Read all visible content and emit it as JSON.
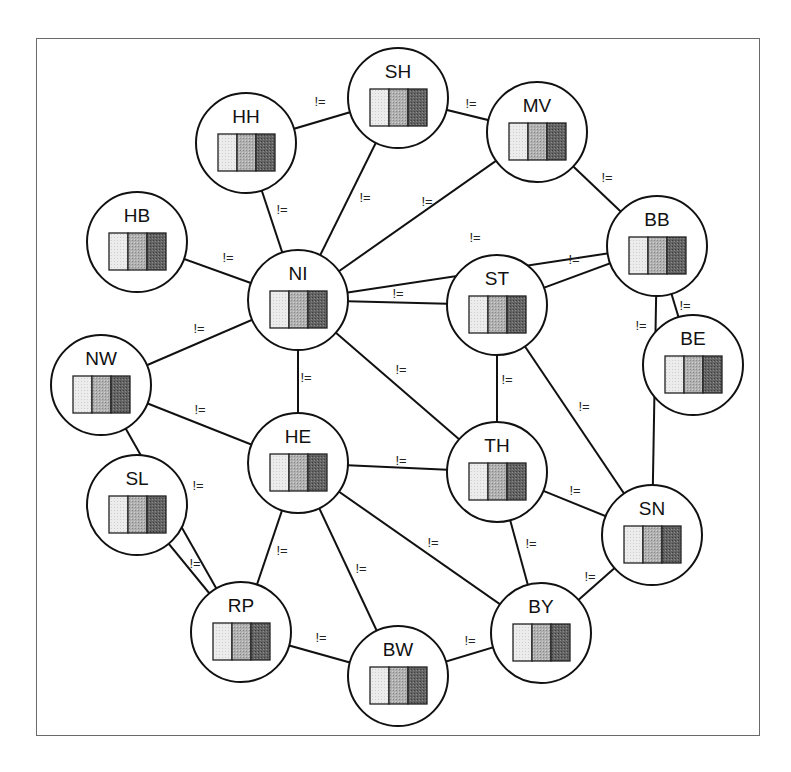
{
  "diagram": {
    "type": "constraint-graph",
    "edge_label": "!=",
    "frame": {
      "x": 36,
      "y": 38,
      "w": 724,
      "h": 698
    },
    "node_radius": 50,
    "swatch_colors": [
      "#e8e8e8",
      "#a9a9a9",
      "#5e5e5e"
    ],
    "nodes": [
      {
        "id": "SH",
        "label": "SH",
        "x": 398,
        "y": 98
      },
      {
        "id": "HH",
        "label": "HH",
        "x": 246,
        "y": 143
      },
      {
        "id": "MV",
        "label": "MV",
        "x": 537,
        "y": 132
      },
      {
        "id": "HB",
        "label": "HB",
        "x": 137,
        "y": 242
      },
      {
        "id": "BB",
        "label": "BB",
        "x": 657,
        "y": 246
      },
      {
        "id": "NI",
        "label": "NI",
        "x": 298,
        "y": 300
      },
      {
        "id": "ST",
        "label": "ST",
        "x": 497,
        "y": 305
      },
      {
        "id": "BE",
        "label": "BE",
        "x": 693,
        "y": 365
      },
      {
        "id": "NW",
        "label": "NW",
        "x": 101,
        "y": 385
      },
      {
        "id": "HE",
        "label": "HE",
        "x": 298,
        "y": 463
      },
      {
        "id": "TH",
        "label": "TH",
        "x": 497,
        "y": 472
      },
      {
        "id": "SN",
        "label": "SN",
        "x": 652,
        "y": 535
      },
      {
        "id": "SL",
        "label": "SL",
        "x": 137,
        "y": 505
      },
      {
        "id": "RP",
        "label": "RP",
        "x": 241,
        "y": 632
      },
      {
        "id": "BY",
        "label": "BY",
        "x": 541,
        "y": 633
      },
      {
        "id": "BW",
        "label": "BW",
        "x": 398,
        "y": 676
      }
    ],
    "edges": [
      {
        "a": "HH",
        "b": "SH",
        "lx": 320,
        "ly": 106
      },
      {
        "a": "SH",
        "b": "MV",
        "lx": 471,
        "ly": 108
      },
      {
        "a": "HH",
        "b": "NI",
        "lx": 282,
        "ly": 214
      },
      {
        "a": "SH",
        "b": "NI",
        "lx": 365,
        "ly": 202
      },
      {
        "a": "MV",
        "b": "NI",
        "lx": 427,
        "ly": 206
      },
      {
        "a": "MV",
        "b": "BB",
        "lx": 607,
        "ly": 182
      },
      {
        "a": "HB",
        "b": "NI",
        "lx": 228,
        "ly": 262
      },
      {
        "a": "NI",
        "b": "BB",
        "lx": 475,
        "ly": 242
      },
      {
        "a": "NI",
        "b": "ST",
        "lx": 398,
        "ly": 298
      },
      {
        "a": "ST",
        "b": "BB",
        "lx": 574,
        "ly": 264
      },
      {
        "a": "BB",
        "b": "BE",
        "lx": 685,
        "ly": 310
      },
      {
        "a": "BB",
        "b": "SN",
        "lx": 641,
        "ly": 330
      },
      {
        "a": "NW",
        "b": "NI",
        "lx": 199,
        "ly": 333
      },
      {
        "a": "NI",
        "b": "HE",
        "lx": 306,
        "ly": 382
      },
      {
        "a": "NI",
        "b": "TH",
        "lx": 401,
        "ly": 374
      },
      {
        "a": "ST",
        "b": "TH",
        "lx": 507,
        "ly": 384
      },
      {
        "a": "ST",
        "b": "SN",
        "lx": 584,
        "ly": 411
      },
      {
        "a": "NW",
        "b": "HE",
        "lx": 200,
        "ly": 414
      },
      {
        "a": "HE",
        "b": "TH",
        "lx": 401,
        "ly": 465
      },
      {
        "a": "TH",
        "b": "SN",
        "lx": 575,
        "ly": 495
      },
      {
        "a": "NW",
        "b": "RP",
        "lx": 198,
        "ly": 490
      },
      {
        "a": "SL",
        "b": "RP",
        "lx": 195,
        "ly": 568
      },
      {
        "a": "HE",
        "b": "RP",
        "lx": 282,
        "ly": 555
      },
      {
        "a": "HE",
        "b": "BW",
        "lx": 361,
        "ly": 573
      },
      {
        "a": "HE",
        "b": "BY",
        "lx": 433,
        "ly": 547
      },
      {
        "a": "TH",
        "b": "BY",
        "lx": 531,
        "ly": 548
      },
      {
        "a": "SN",
        "b": "BY",
        "lx": 590,
        "ly": 581
      },
      {
        "a": "RP",
        "b": "BW",
        "lx": 321,
        "ly": 642
      },
      {
        "a": "BW",
        "b": "BY",
        "lx": 470,
        "ly": 645
      }
    ]
  },
  "caption": ""
}
